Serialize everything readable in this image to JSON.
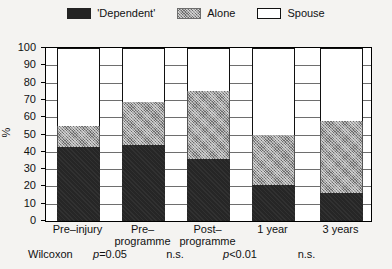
{
  "legend": {
    "entries": [
      {
        "label": "'Dependent'",
        "icon": "swatch-dark-filled",
        "color": "#232323"
      },
      {
        "label": "Alone",
        "icon": "swatch-gray-stippled",
        "color": "#9b9b9b"
      },
      {
        "label": "Spouse",
        "icon": "swatch-white-outlined",
        "color": "#ffffff"
      }
    ]
  },
  "axes": {
    "ylabel": "%",
    "yticks": [
      "100",
      "90",
      "80",
      "70",
      "60",
      "50",
      "40",
      "30",
      "20",
      "10",
      "0"
    ]
  },
  "wilcoxon": {
    "title": "Wilcoxon",
    "values": [
      {
        "prefix": "p",
        "rest": "=0.05"
      },
      {
        "prefix": "",
        "rest": "n.s."
      },
      {
        "prefix": "p",
        "rest": "<0.01"
      },
      {
        "prefix": "",
        "rest": "n.s."
      }
    ]
  },
  "chart_data": {
    "type": "bar",
    "subtype": "stacked-100",
    "title": "",
    "xlabel": "",
    "ylabel": "%",
    "ylim": [
      0,
      100
    ],
    "ytick_step": 10,
    "grid": true,
    "legend_position": "top-center",
    "categories": [
      "Pre–injury",
      "Pre–\nprogramme",
      "Post–\nprogramme",
      "1 year",
      "3 years"
    ],
    "category_lines": [
      [
        "Pre–injury"
      ],
      [
        "Pre–",
        "programme"
      ],
      [
        "Post–",
        "programme"
      ],
      [
        "1 year"
      ],
      [
        "3 years"
      ]
    ],
    "series": [
      {
        "name": "'Dependent'",
        "color": "#232323",
        "values": [
          43,
          44,
          36,
          21,
          16
        ]
      },
      {
        "name": "Alone",
        "color": "#9b9b9b",
        "values": [
          12,
          25,
          39,
          29,
          42
        ]
      },
      {
        "name": "Spouse",
        "color": "#ffffff",
        "values": [
          45,
          31,
          25,
          50,
          42
        ]
      }
    ],
    "cumulative_tops": {
      "dependent": [
        43,
        44,
        36,
        21,
        16
      ],
      "dependent_plus_alone": [
        55,
        69,
        75,
        50,
        58
      ]
    },
    "annotations": [
      {
        "label": "Wilcoxon p=0.05",
        "between": [
          "Pre–injury",
          "Pre–programme"
        ]
      },
      {
        "label": "Wilcoxon n.s.",
        "between": [
          "Pre–programme",
          "Post–programme"
        ]
      },
      {
        "label": "Wilcoxon p<0.01",
        "between": [
          "Post–programme",
          "1 year"
        ]
      },
      {
        "label": "Wilcoxon n.s.",
        "between": [
          "1 year",
          "3 years"
        ]
      }
    ]
  }
}
